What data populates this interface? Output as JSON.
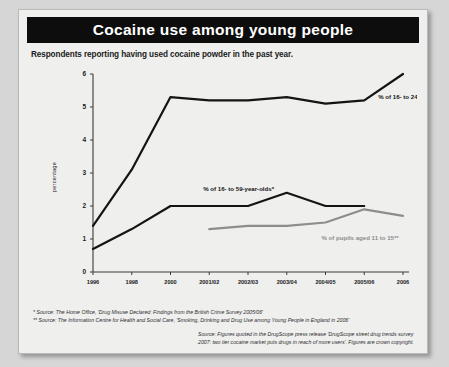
{
  "header": {
    "title": "Cocaine use among young people"
  },
  "subtitle": "Respondents reporting having used cocaine powder in the past year.",
  "footnotes": [
    "* Source: The Home Office, 'Drug Misuse Declared: Findings from the British Crime Survey 2005/06'",
    "** Source: The Information Centre for Health and Social Care, 'Smoking, Drinking and Drug Use among Young People in England in 2006'"
  ],
  "source_note": [
    "Source: Figures quoted in the DrugScope press release 'DrugScope street drug trends survey",
    "2007: two tier cocaine market puts drugs in reach of more users'. Figures are crown copyright."
  ],
  "colors": {
    "title_bar": "#0d0d0d",
    "card": "#efefee",
    "series_dark": "#141414",
    "series_gray": "#8d8d8d",
    "axis": "#3a3a3a"
  },
  "chart_data": {
    "type": "line",
    "title": "Cocaine use among young people",
    "subtitle": "Respondents reporting having used cocaine powder in the past year.",
    "xlabel": "",
    "ylabel": "percentage",
    "ylim": [
      0,
      6
    ],
    "yticks": [
      0,
      1,
      2,
      3,
      4,
      5,
      6
    ],
    "ytick_labels": [
      "0",
      "1",
      "2",
      "3",
      "4",
      "5",
      "6"
    ],
    "categories": [
      "1996",
      "1998",
      "2000",
      "2001/02",
      "2002/03",
      "2003/04",
      "2004/05",
      "2005/06",
      "2006"
    ],
    "grid": false,
    "legend": "inline-annotations",
    "series": [
      {
        "name": "% of 16- to 24-year-olds*",
        "color": "#141414",
        "label_position": "right",
        "values": [
          1.4,
          3.1,
          5.3,
          5.2,
          5.2,
          5.3,
          5.1,
          5.2,
          6.0
        ]
      },
      {
        "name": "% of 16- to 59-year-olds*",
        "color": "#141414",
        "label_position": "above",
        "values": [
          0.7,
          1.3,
          2.0,
          2.0,
          2.0,
          2.4,
          2.0,
          2.0,
          null
        ]
      },
      {
        "name": "% of pupils aged 11 to 15**",
        "color": "#8d8d8d",
        "label_position": "below-right",
        "values": [
          null,
          null,
          null,
          1.3,
          1.4,
          1.4,
          1.5,
          1.9,
          1.7
        ]
      }
    ]
  }
}
